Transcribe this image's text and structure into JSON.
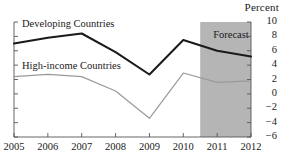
{
  "chart_data": {
    "type": "line",
    "title": "",
    "ylabel": "Percent",
    "xlabel": "",
    "categories": [
      "2005",
      "2006",
      "2007",
      "2008",
      "2009",
      "2010",
      "2011",
      "2012"
    ],
    "x": [
      2005,
      2006,
      2007,
      2008,
      2009,
      2010,
      2011,
      2012
    ],
    "ylim": [
      -6,
      10
    ],
    "yticks": [
      "10",
      "8",
      "6",
      "4",
      "2",
      "0",
      "-2",
      "-4",
      "-6"
    ],
    "ytick_values": [
      10,
      8,
      6,
      4,
      2,
      0,
      -2,
      -4,
      -6
    ],
    "grid": false,
    "legend_position": "inline-labels",
    "series": [
      {
        "name": "Developing Countries",
        "color": "#1a1a1a",
        "values": [
          7.0,
          7.8,
          8.4,
          5.8,
          2.7,
          7.5,
          6.0,
          5.2
        ]
      },
      {
        "name": "High-income Countries",
        "color": "#9a9a9a",
        "values": [
          2.4,
          2.7,
          2.4,
          0.4,
          -3.4,
          2.9,
          1.6,
          1.8
        ]
      }
    ],
    "annotations": [
      {
        "name": "forecast-region",
        "label": "Forecast",
        "x_start": 2010.5,
        "x_end": 2012,
        "fill": "#b5b5b5"
      }
    ]
  },
  "labels": {
    "percent": "Percent",
    "forecast": "Forecast",
    "developing": "Developing Countries",
    "high_income": "High-income Countries"
  }
}
